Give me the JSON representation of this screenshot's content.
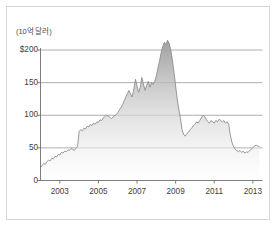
{
  "figure": {
    "axis_title": "(10억 달러)",
    "border_color": "#d6d6d6",
    "background": "#ffffff",
    "line_color": "#8e8e8e",
    "grid_color": "#9a9a9a",
    "axis_color": "#6e6e6e",
    "fill_top_color": "#9b9b9b",
    "fill_bottom_color": "#fdfdfd"
  },
  "chart_data": {
    "type": "area",
    "title": "",
    "subtitle": "",
    "xlabel": "",
    "ylabel": "(10억 달러)",
    "grid": true,
    "legend": "none",
    "xlim": [
      2002.0,
      2013.5
    ],
    "ylim": [
      0,
      215
    ],
    "ytick_labels": [
      "$200",
      "150",
      "100",
      "50",
      "0"
    ],
    "ytick_values": [
      200,
      150,
      100,
      50,
      0
    ],
    "xtick_labels": [
      "2003",
      "2005",
      "2007",
      "2009",
      "2011",
      "2013"
    ],
    "xtick_values": [
      2003,
      2005,
      2007,
      2009,
      2011,
      2013
    ],
    "series": [
      {
        "name": "Value",
        "x": [
          2002.0,
          2002.08,
          2002.17,
          2002.25,
          2002.33,
          2002.42,
          2002.5,
          2002.58,
          2002.67,
          2002.75,
          2002.83,
          2002.92,
          2003.0,
          2003.08,
          2003.17,
          2003.25,
          2003.33,
          2003.42,
          2003.5,
          2003.58,
          2003.67,
          2003.75,
          2003.83,
          2003.92,
          2004.0,
          2004.08,
          2004.17,
          2004.25,
          2004.33,
          2004.42,
          2004.5,
          2004.58,
          2004.67,
          2004.75,
          2004.83,
          2004.92,
          2005.0,
          2005.08,
          2005.17,
          2005.25,
          2005.33,
          2005.42,
          2005.5,
          2005.58,
          2005.67,
          2005.75,
          2005.83,
          2005.92,
          2006.0,
          2006.08,
          2006.17,
          2006.25,
          2006.33,
          2006.42,
          2006.5,
          2006.58,
          2006.67,
          2006.75,
          2006.83,
          2006.92,
          2007.0,
          2007.08,
          2007.17,
          2007.25,
          2007.33,
          2007.42,
          2007.5,
          2007.58,
          2007.67,
          2007.75,
          2007.83,
          2007.92,
          2008.0,
          2008.08,
          2008.17,
          2008.25,
          2008.33,
          2008.42,
          2008.5,
          2008.58,
          2008.67,
          2008.75,
          2008.83,
          2008.92,
          2009.0,
          2009.08,
          2009.17,
          2009.25,
          2009.33,
          2009.42,
          2009.5,
          2009.58,
          2009.67,
          2009.75,
          2009.83,
          2009.92,
          2010.0,
          2010.08,
          2010.17,
          2010.25,
          2010.33,
          2010.42,
          2010.5,
          2010.58,
          2010.67,
          2010.75,
          2010.83,
          2010.92,
          2011.0,
          2011.08,
          2011.17,
          2011.25,
          2011.33,
          2011.42,
          2011.5,
          2011.58,
          2011.67,
          2011.75,
          2011.83,
          2011.92,
          2012.0,
          2012.08,
          2012.17,
          2012.25,
          2012.33,
          2012.42,
          2012.5,
          2012.58,
          2012.67,
          2012.75,
          2012.83,
          2012.92,
          2013.0,
          2013.08,
          2013.17,
          2013.25,
          2013.33
        ],
        "values": [
          20,
          23,
          26,
          25,
          29,
          31,
          30,
          34,
          33,
          37,
          36,
          40,
          39,
          43,
          42,
          45,
          44,
          47,
          46,
          49,
          48,
          46,
          49,
          52,
          75,
          78,
          76,
          80,
          79,
          83,
          82,
          86,
          84,
          88,
          86,
          90,
          89,
          93,
          92,
          96,
          98,
          100,
          99,
          97,
          95,
          97,
          99,
          101,
          104,
          108,
          112,
          116,
          122,
          128,
          133,
          138,
          132,
          128,
          140,
          155,
          145,
          135,
          143,
          158,
          148,
          138,
          146,
          152,
          143,
          150,
          147,
          152,
          160,
          172,
          184,
          196,
          205,
          212,
          208,
          215,
          210,
          200,
          185,
          165,
          145,
          125,
          108,
          95,
          78,
          70,
          68,
          72,
          74,
          78,
          80,
          84,
          86,
          90,
          88,
          92,
          96,
          100,
          98,
          94,
          90,
          88,
          92,
          90,
          88,
          92,
          90,
          94,
          92,
          90,
          92,
          88,
          90,
          86,
          70,
          58,
          52,
          48,
          46,
          44,
          46,
          43,
          45,
          42,
          44,
          43,
          46,
          48,
          50,
          53,
          54,
          53,
          52
        ]
      }
    ]
  }
}
